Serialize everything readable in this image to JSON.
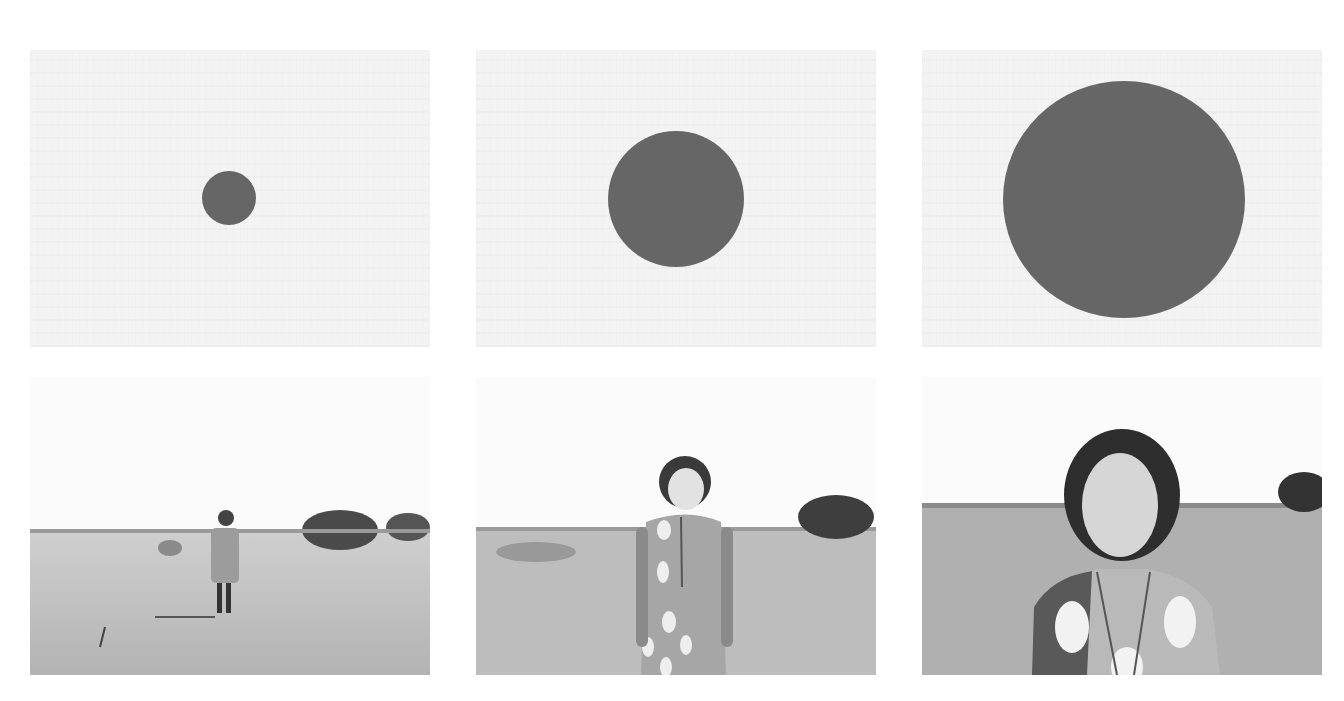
{
  "figure": {
    "layout": "2 rows x 3 columns",
    "colors": {
      "page_background": "#ffffff",
      "top_panel_background": "#f3f3f3",
      "circle_fill": "#666666",
      "sky": "#fbfbfb",
      "ground": "#b8b8b8"
    },
    "top_row": [
      {
        "content": "small dark circle",
        "size": "small",
        "circle_diameter_px": 54
      },
      {
        "content": "medium dark circle",
        "size": "medium",
        "circle_diameter_px": 136
      },
      {
        "content": "large dark circle",
        "size": "large",
        "circle_diameter_px": 242
      }
    ],
    "bottom_row": [
      {
        "content": "woman standing far away in dry field",
        "distance": "far"
      },
      {
        "content": "woman standing mid-distance in dry field",
        "distance": "medium"
      },
      {
        "content": "woman close-up in dry field",
        "distance": "near"
      }
    ]
  }
}
